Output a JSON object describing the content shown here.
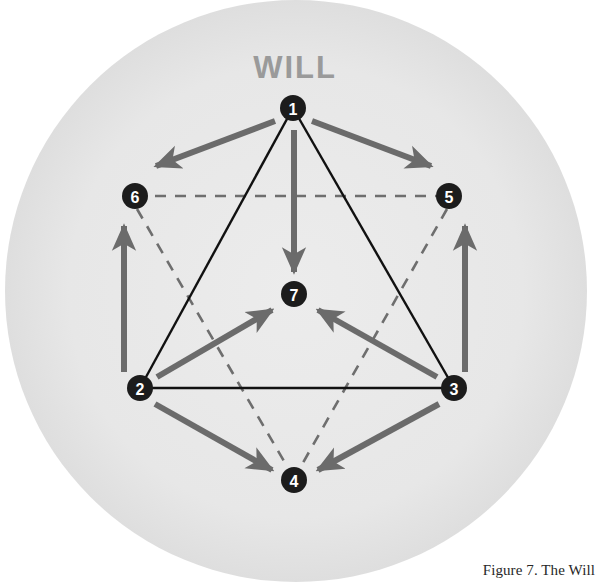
{
  "figure": {
    "title": "WILL",
    "caption": "Figure 7. The Will",
    "title_color": "#9a9a9a",
    "background_disc_color": "#e6e6e6",
    "page_background": "#ffffff"
  },
  "colors": {
    "node_fill": "#1c1c1c",
    "node_text": "#ffffff",
    "solid_edge": "#111111",
    "dashed_edge": "#6e6e6e",
    "arrow": "#6b6b6b"
  },
  "disc": {
    "cx": 296,
    "cy": 291,
    "r": 291
  },
  "nodes": [
    {
      "id": "1",
      "label": "1",
      "cx": 293,
      "cy": 108,
      "r": 13
    },
    {
      "id": "2",
      "label": "2",
      "cx": 140,
      "cy": 388,
      "r": 13
    },
    {
      "id": "3",
      "label": "3",
      "cx": 454,
      "cy": 388,
      "r": 13
    },
    {
      "id": "4",
      "label": "4",
      "cx": 294,
      "cy": 480,
      "r": 13
    },
    {
      "id": "5",
      "label": "5",
      "cx": 449,
      "cy": 196,
      "r": 13
    },
    {
      "id": "6",
      "label": "6",
      "cx": 135,
      "cy": 196,
      "r": 13
    },
    {
      "id": "7",
      "label": "7",
      "cx": 294,
      "cy": 294,
      "r": 13
    }
  ],
  "solid_edges": [
    {
      "name": "edge-1-2",
      "from": "1",
      "to": "2"
    },
    {
      "name": "edge-1-3",
      "from": "1",
      "to": "3"
    },
    {
      "name": "edge-2-3",
      "from": "2",
      "to": "3"
    }
  ],
  "dashed_edges": [
    {
      "name": "dashed-6-5",
      "from": "6",
      "to": "5"
    },
    {
      "name": "dashed-6-4",
      "from": "6",
      "to": "4"
    },
    {
      "name": "dashed-5-4",
      "from": "5",
      "to": "4"
    }
  ],
  "arrows": [
    {
      "name": "arrow-1-to-6",
      "from": "1",
      "to": "6",
      "x1": 275,
      "y1": 121,
      "x2": 156,
      "y2": 166
    },
    {
      "name": "arrow-1-to-5",
      "from": "1",
      "to": "5",
      "x1": 312,
      "y1": 121,
      "x2": 431,
      "y2": 166
    },
    {
      "name": "arrow-1-to-7",
      "from": "1",
      "to": "7",
      "x1": 294,
      "y1": 128,
      "x2": 294,
      "y2": 272
    },
    {
      "name": "arrow-2-to-6",
      "from": "2",
      "to": "6",
      "x1": 124,
      "y1": 372,
      "x2": 124,
      "y2": 226
    },
    {
      "name": "arrow-3-to-5",
      "from": "3",
      "to": "5",
      "x1": 465,
      "y1": 372,
      "x2": 465,
      "y2": 226
    },
    {
      "name": "arrow-2-to-7",
      "from": "2",
      "to": "7",
      "x1": 158,
      "y1": 377,
      "x2": 272,
      "y2": 310
    },
    {
      "name": "arrow-3-to-7",
      "from": "3",
      "to": "7",
      "x1": 436,
      "y1": 377,
      "x2": 318,
      "y2": 310
    },
    {
      "name": "arrow-2-to-4",
      "from": "2",
      "to": "4",
      "x1": 155,
      "y1": 404,
      "x2": 272,
      "y2": 470
    },
    {
      "name": "arrow-3-to-4",
      "from": "3",
      "to": "4",
      "x1": 439,
      "y1": 404,
      "x2": 318,
      "y2": 470
    }
  ],
  "title_position": {
    "x": 295,
    "y": 70
  }
}
